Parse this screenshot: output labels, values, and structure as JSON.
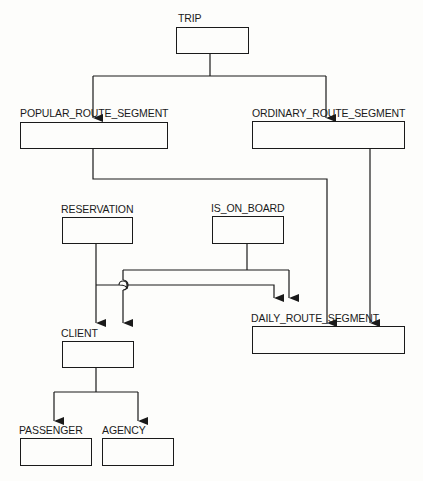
{
  "diagram": {
    "type": "hierarchy-diagram",
    "entities": [
      {
        "id": "trip",
        "label": "TRIP"
      },
      {
        "id": "popular_route_segment",
        "label": "POPULAR_ROUTE_SEGMENT"
      },
      {
        "id": "ordinary_route_segment",
        "label": "ORDINARY_ROUTE_SEGMENT"
      },
      {
        "id": "reservation",
        "label": "RESERVATION"
      },
      {
        "id": "is_on_board",
        "label": "IS_ON_BOARD"
      },
      {
        "id": "daily_route_segment",
        "label": "DAILY_ROUTE_SEGMENT"
      },
      {
        "id": "client",
        "label": "CLIENT"
      },
      {
        "id": "passenger",
        "label": "PASSENGER"
      },
      {
        "id": "agency",
        "label": "AGENCY"
      }
    ],
    "edges": [
      {
        "from": "trip",
        "to": "popular_route_segment"
      },
      {
        "from": "trip",
        "to": "ordinary_route_segment"
      },
      {
        "from": "popular_route_segment",
        "to": "daily_route_segment"
      },
      {
        "from": "ordinary_route_segment",
        "to": "daily_route_segment"
      },
      {
        "from": "reservation",
        "to": "client"
      },
      {
        "from": "reservation",
        "to": "daily_route_segment"
      },
      {
        "from": "is_on_board",
        "to": "client"
      },
      {
        "from": "is_on_board",
        "to": "daily_route_segment"
      },
      {
        "from": "client",
        "to": "passenger"
      },
      {
        "from": "client",
        "to": "agency"
      }
    ],
    "colors": {
      "line": "#1a1a1a",
      "background": "#fdfdfb"
    }
  }
}
